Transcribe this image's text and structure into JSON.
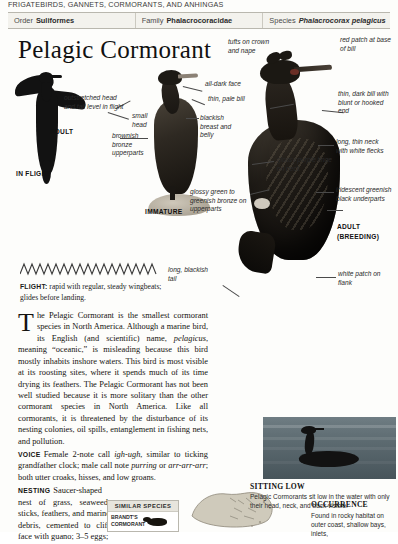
{
  "running_head": "FRIGATEBIRDS, GANNETS, CORMORANTS, AND ANHINGAS",
  "taxonomy": {
    "order": {
      "key": "Order",
      "value": "Suliformes"
    },
    "family": {
      "key": "Family",
      "value": "Phalacrocoracidae"
    },
    "species": {
      "key": "Species",
      "value": "Phalacrocorax pelagicus"
    }
  },
  "title": "Pelagic Cormorant",
  "plate": {
    "annotations": [
      "outstretched head and tail level in flight",
      "small head",
      "brownish bronze upperparts",
      "all-dark face",
      "thin, pale bill",
      "blackish breast and belly",
      "tufts on crown and nape",
      "glossy purple tinge on neck",
      "glossy green to greenish bronze on upperparts",
      "red patch at base of bill",
      "thin, dark bill with blunt or hooked end",
      "long, thin neck with white flecks",
      "iridescent greenish black underparts",
      "long, blackish tail",
      "white patch on flank"
    ],
    "captions": {
      "adult": "ADULT",
      "in_flight": "IN FLIGHT",
      "immature": "IMMATURE",
      "adult_breeding_line1": "ADULT",
      "adult_breeding_line2": "(BREEDING)"
    }
  },
  "flight": {
    "label": "FLIGHT:",
    "text": "rapid with regular, steady wingbeats; glides before landing."
  },
  "body": {
    "dropcap": "T",
    "para1_rest": "he Pelagic Cormorant is the smallest cormorant species in North America. Although a marine bird, its English (and scientific) name, ",
    "para1_ital": "pelagicus",
    "para1_cont": ", meaning “oceanic,” is misleading because this bird mostly inhabits inshore waters. This bird is most visible at its roosting sites, where it spends much of its time drying its feathers. The Pelagic Cormorant has not been well studied because it is more solitary than the other cormorant species in North America. Like all cormorants, it is threatened by the disturbance of its nesting colonies, oil spills, entanglement in fishing nets, and pollution.",
    "voice_head": "VOICE",
    "voice_a": "Female 2-note call ",
    "voice_ital1": "igh-ugh",
    "voice_b": ", similar to ticking grandfather clock; male call note ",
    "voice_ital2": "purring",
    "voice_c": " or ",
    "voice_ital3": "arr-arr-arr",
    "voice_d": "; both utter croaks, hisses, and low groans.",
    "nesting_head": "NESTING",
    "nesting_text": "Saucer-shaped nest of grass, seaweed, sticks, feathers, and marine debris, cemented to cliff face with guano; 3–5 eggs;"
  },
  "similar_species": {
    "header": "SIMILAR SPECIES",
    "items": [
      {
        "name_line1": "BRANDT'S",
        "name_line2": "CORMORANT"
      }
    ]
  },
  "sitting_low": {
    "heading": "SITTING LOW",
    "text": "Pelagic Cormorants sit low in the water with only their head, neck, and back visible."
  },
  "occurrence": {
    "heading": "OCCURRENCE",
    "text": "Found in rocky habitat on outer coast, shallow bays, inlets,"
  },
  "colors": {
    "page_bg": "#fdfdfb",
    "rule": "#b9b7ae",
    "taxbar_bg": "#f3f2ed",
    "ink": "#15130f",
    "water": "#5c6a70"
  }
}
